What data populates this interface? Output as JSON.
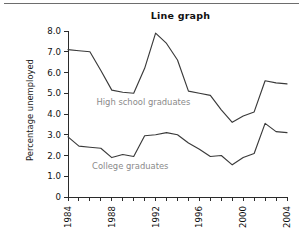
{
  "figure": {
    "title": "Line graph",
    "top_rule_color": "#6d6d6d"
  },
  "axes": {
    "ylabel": "Percentage unemployed",
    "y_ticks": [
      "0",
      "1.0",
      "2.0",
      "3.0",
      "4.0",
      "5.0",
      "6.0",
      "7.0",
      "8.0"
    ],
    "x_ticks": [
      "1984",
      "1988",
      "1992",
      "1996",
      "2000",
      "2004"
    ]
  },
  "series_labels": {
    "high_school": "High school graduates",
    "college": "College graduates"
  },
  "colors": {
    "line": "#3a3a3a",
    "axis": "#2b2b2b",
    "series_label": "#8a8a8a",
    "title": "#111111"
  },
  "chart_data": {
    "type": "line",
    "title": "Line graph",
    "xlabel": "",
    "ylabel": "Percentage unemployed",
    "xlim": [
      1984,
      2004
    ],
    "ylim": [
      0,
      8
    ],
    "grid": false,
    "legend": "inline-annotation",
    "x": [
      1984,
      1985,
      1986,
      1987,
      1988,
      1989,
      1990,
      1991,
      1992,
      1993,
      1994,
      1995,
      1996,
      1997,
      1998,
      1999,
      2000,
      2001,
      2002,
      2003,
      2004
    ],
    "x_tick_labels": [
      "1984",
      "1988",
      "1992",
      "1996",
      "2000",
      "2004"
    ],
    "x_tick_values": [
      1984,
      1988,
      1992,
      1996,
      2000,
      2004
    ],
    "y_tick_labels": [
      "0",
      "1.0",
      "2.0",
      "3.0",
      "4.0",
      "5.0",
      "6.0",
      "7.0",
      "8.0"
    ],
    "y_tick_values": [
      0,
      1,
      2,
      3,
      4,
      5,
      6,
      7,
      8
    ],
    "series": [
      {
        "name": "High school graduates",
        "values": [
          7.1,
          7.05,
          7.0,
          6.1,
          5.15,
          5.05,
          5.0,
          6.2,
          7.9,
          7.4,
          6.6,
          5.1,
          5.0,
          4.9,
          4.2,
          3.6,
          3.9,
          4.1,
          5.6,
          5.5,
          5.45
        ]
      },
      {
        "name": "College graduates",
        "values": [
          2.9,
          2.45,
          2.4,
          2.35,
          1.9,
          2.05,
          1.95,
          2.95,
          3.0,
          3.1,
          3.0,
          2.6,
          2.3,
          1.95,
          2.0,
          1.55,
          1.9,
          2.1,
          3.55,
          3.15,
          3.1
        ]
      }
    ],
    "annotations": [
      {
        "text": "High school graduates",
        "x": 1986.6,
        "y": 4.45
      },
      {
        "text": "College graduates",
        "x": 1986.2,
        "y": 1.35
      }
    ]
  }
}
